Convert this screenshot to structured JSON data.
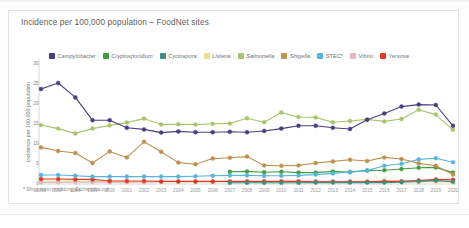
{
  "card": {
    "title": "Incidence per 100,000 population – FoodNet sites",
    "footnote_prefix": "* Shiga toxin-producing ",
    "footnote_italic": "Escherichia coli"
  },
  "page": {
    "bottom_mark": ""
  },
  "chart_data": {
    "type": "line",
    "title": "Incidence per 100,000 population – FoodNet sites",
    "xlabel": "",
    "ylabel": "Incidence per 100,000 population",
    "ylim": [
      0,
      30
    ],
    "yticks": [
      0,
      5,
      10,
      15,
      20,
      25,
      30
    ],
    "grid": false,
    "legend_position": "top",
    "categories": [
      1996,
      1997,
      1998,
      1999,
      2000,
      2001,
      2002,
      2003,
      2004,
      2005,
      2006,
      2007,
      2008,
      2009,
      2010,
      2011,
      2012,
      2013,
      2014,
      2015,
      2016,
      2017,
      2018,
      2019,
      2020
    ],
    "series": [
      {
        "name": "Campylobacter",
        "color": "#4c3d82",
        "values": [
          23.5,
          25.0,
          21.4,
          15.7,
          15.7,
          13.8,
          13.4,
          12.6,
          12.9,
          12.7,
          12.7,
          12.8,
          12.7,
          13.0,
          13.6,
          14.3,
          14.3,
          13.8,
          13.5,
          15.8,
          17.4,
          19.1,
          19.6,
          19.5,
          14.3
        ],
        "marker": "circle"
      },
      {
        "name": "Cryptosporidium",
        "color": "#3f9e3f",
        "values": [
          0.0,
          0.0,
          0.0,
          0.0,
          0.0,
          0.0,
          0.0,
          0.0,
          0.0,
          0.0,
          0.0,
          2.8,
          2.9,
          2.7,
          2.8,
          2.6,
          2.6,
          2.9,
          2.7,
          3.1,
          3.2,
          3.5,
          3.8,
          3.9,
          2.6
        ],
        "marker": "circle"
      },
      {
        "name": "Cyclospora",
        "color": "#3f8f7f",
        "values": [
          0.0,
          0.0,
          0.0,
          0.0,
          0.0,
          0.0,
          0.0,
          0.0,
          0.0,
          0.0,
          0.0,
          0.05,
          0.05,
          0.05,
          0.05,
          0.05,
          0.1,
          0.1,
          0.1,
          0.1,
          0.1,
          0.2,
          0.4,
          0.6,
          0.3
        ],
        "marker": "circle"
      },
      {
        "name": "Listeria",
        "color": "#e8e08a",
        "values": [
          0.5,
          0.5,
          0.4,
          0.4,
          0.3,
          0.3,
          0.3,
          0.3,
          0.3,
          0.3,
          0.3,
          0.3,
          0.3,
          0.3,
          0.3,
          0.3,
          0.3,
          0.3,
          0.2,
          0.2,
          0.3,
          0.3,
          0.3,
          0.3,
          0.2
        ],
        "marker": "circle"
      },
      {
        "name": "Salmonella",
        "color": "#a9c46c",
        "values": [
          14.5,
          13.6,
          12.4,
          13.6,
          14.4,
          15.1,
          16.1,
          14.6,
          14.7,
          14.6,
          14.8,
          14.9,
          16.2,
          15.2,
          17.6,
          16.5,
          16.4,
          15.2,
          15.5,
          15.9,
          15.4,
          16.0,
          18.3,
          17.1,
          13.3
        ],
        "marker": "circle"
      },
      {
        "name": "Shigella",
        "color": "#c09050",
        "values": [
          8.9,
          8.0,
          7.5,
          5.0,
          7.9,
          6.4,
          10.3,
          7.8,
          5.1,
          4.7,
          6.1,
          6.3,
          6.6,
          4.4,
          4.3,
          4.4,
          5.0,
          5.4,
          5.8,
          5.5,
          6.4,
          6.0,
          4.9,
          4.3,
          2.1
        ],
        "marker": "circle"
      },
      {
        "name": "STEC*",
        "color": "#56b4e0",
        "values": [
          2.0,
          2.0,
          1.8,
          1.6,
          1.6,
          1.6,
          1.6,
          1.6,
          1.6,
          1.7,
          1.8,
          1.9,
          1.9,
          1.8,
          1.8,
          1.9,
          2.1,
          2.4,
          2.8,
          3.1,
          4.3,
          4.8,
          5.9,
          6.2,
          5.2
        ],
        "marker": "circle"
      },
      {
        "name": "Vibrio",
        "color": "#dfb9bd",
        "values": [
          0.15,
          0.15,
          0.2,
          0.2,
          0.2,
          0.2,
          0.2,
          0.3,
          0.3,
          0.3,
          0.3,
          0.3,
          0.3,
          0.3,
          0.4,
          0.4,
          0.4,
          0.4,
          0.4,
          0.4,
          0.5,
          0.5,
          0.6,
          0.6,
          0.5
        ],
        "marker": "circle"
      },
      {
        "name": "Yersinia",
        "color": "#e03a24",
        "values": [
          1.0,
          1.0,
          0.9,
          0.9,
          0.5,
          0.5,
          0.5,
          0.4,
          0.4,
          0.4,
          0.4,
          0.4,
          0.4,
          0.4,
          0.4,
          0.4,
          0.3,
          0.3,
          0.3,
          0.3,
          0.4,
          0.4,
          0.6,
          0.9,
          0.8
        ],
        "marker": "circle"
      }
    ]
  }
}
